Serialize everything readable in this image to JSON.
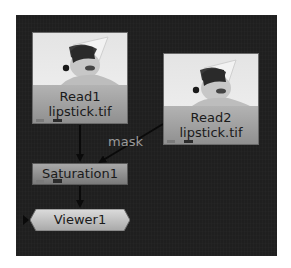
{
  "node_graph": {
    "nodes": [
      {
        "id": "read1",
        "type": "Read",
        "name": "Read1",
        "file": "lipstick.tif"
      },
      {
        "id": "read2",
        "type": "Read",
        "name": "Read2",
        "file": "lipstick.tif"
      },
      {
        "id": "saturation1",
        "type": "Saturation",
        "name": "Saturation1"
      },
      {
        "id": "viewer1",
        "type": "Viewer",
        "name": "Viewer1"
      }
    ],
    "edges": [
      {
        "from": "read1",
        "to": "saturation1",
        "input": "main"
      },
      {
        "from": "read2",
        "to": "saturation1",
        "input": "mask",
        "label": "mask"
      },
      {
        "from": "saturation1",
        "to": "viewer1",
        "input": "main"
      }
    ],
    "colors": {
      "canvas": "#1f1f1f",
      "read_node": "#a5a5a5",
      "saturation_node": "#909090",
      "viewer_node": "#c8c8c8",
      "edge": "#0a0a0a",
      "mask_label": "#9a9a9a"
    }
  }
}
